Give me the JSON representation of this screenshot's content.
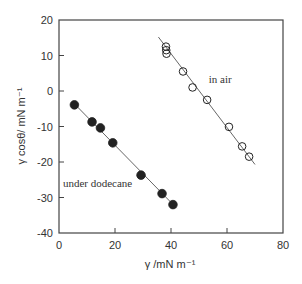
{
  "chart_data": {
    "type": "scatter",
    "title": "",
    "xlabel": "γ /mN m⁻¹",
    "ylabel": "γ cosθ/ mN m⁻¹",
    "xlim": [
      0,
      80
    ],
    "ylim": [
      -40,
      20
    ],
    "xticks": [
      0,
      20,
      40,
      60,
      80
    ],
    "yticks": [
      20,
      10,
      0,
      -10,
      -20,
      -30,
      -40
    ],
    "grid": false,
    "legend": null,
    "series": [
      {
        "name": "in air",
        "marker": "open-circle",
        "fit_line": {
          "x": [
            35.5,
            70.0
          ],
          "y": [
            15.2,
            -20.7
          ]
        },
        "points": [
          {
            "x": 38.2,
            "y": 12.5
          },
          {
            "x": 38.3,
            "y": 11.5
          },
          {
            "x": 38.4,
            "y": 10.5
          },
          {
            "x": 44.3,
            "y": 5.5
          },
          {
            "x": 47.7,
            "y": 1.0
          },
          {
            "x": 52.9,
            "y": -2.5
          },
          {
            "x": 60.7,
            "y": -10.1
          },
          {
            "x": 65.4,
            "y": -15.6
          },
          {
            "x": 67.9,
            "y": -18.5
          }
        ]
      },
      {
        "name": "under dodecane",
        "marker": "filled-circle",
        "fit_line": {
          "x": [
            5.0,
            42.0
          ],
          "y": [
            -3.2,
            -33.0
          ]
        },
        "points": [
          {
            "x": 5.5,
            "y": -3.9
          },
          {
            "x": 11.8,
            "y": -8.7
          },
          {
            "x": 14.8,
            "y": -10.4
          },
          {
            "x": 19.2,
            "y": -14.6
          },
          {
            "x": 29.3,
            "y": -23.7
          },
          {
            "x": 36.8,
            "y": -28.9
          },
          {
            "x": 40.7,
            "y": -32.0
          }
        ]
      }
    ],
    "annotations": [
      {
        "text": "in air",
        "x": 53.5,
        "y": 2.3
      },
      {
        "text": "under dodecane",
        "x": 1.4,
        "y": -27.0
      }
    ]
  },
  "colors": {
    "axis": "#444444",
    "marker": "#222222",
    "line": "#555555",
    "background": "#ffffff"
  }
}
